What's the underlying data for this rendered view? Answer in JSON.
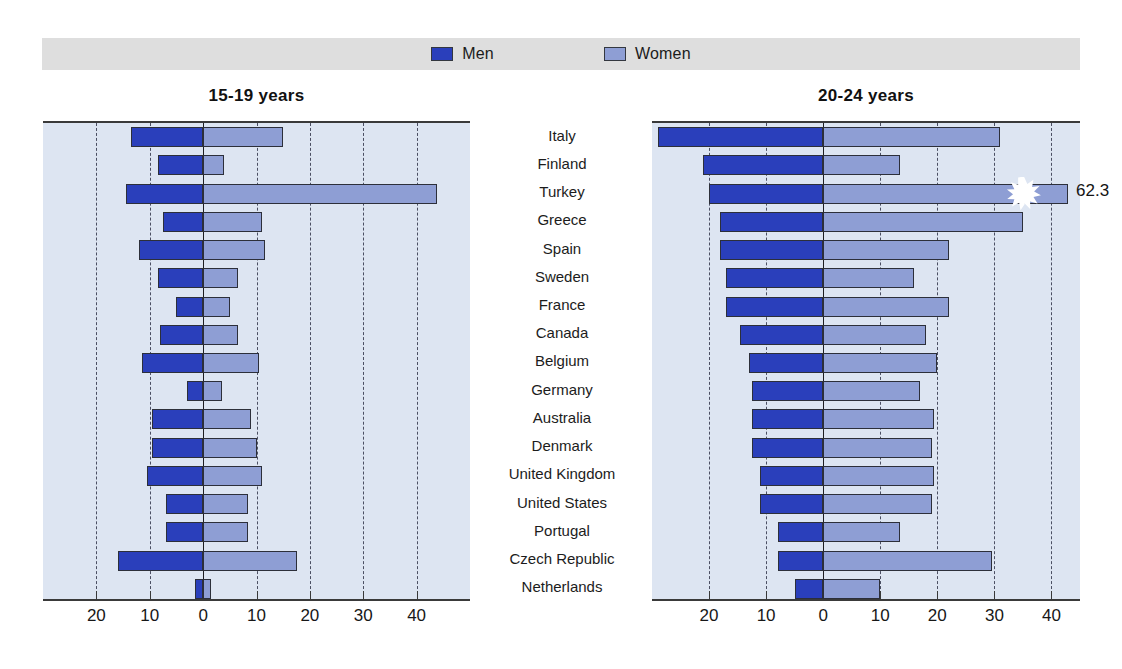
{
  "legend": {
    "items": [
      {
        "label": "Men",
        "color": "#2a3fbb",
        "icon": "legend-swatch-men"
      },
      {
        "label": "Women",
        "color": "#8e9ed4",
        "icon": "legend-swatch-women"
      }
    ],
    "band_color": "#dedede"
  },
  "panels": {
    "left_title": "15-19 years",
    "right_title": "20-24 years"
  },
  "chart_data": [
    {
      "type": "bar",
      "title": "15-19 years",
      "orientation": "horizontal",
      "layout": "bidirectional-pyramid",
      "grid": true,
      "legend_position": "top-center",
      "xlabel": "",
      "ylabel": "",
      "axis_ticks": [
        "30",
        "20",
        "10",
        "0",
        "10",
        "20",
        "30",
        "40",
        "50"
      ],
      "xlim": [
        -30,
        50
      ],
      "categories": [
        "Italy",
        "Finland",
        "Turkey",
        "Greece",
        "Spain",
        "Sweden",
        "France",
        "Canada",
        "Belgium",
        "Germany",
        "Australia",
        "Denmark",
        "United Kingdom",
        "United States",
        "Portugal",
        "Czech Republic",
        "Netherlands"
      ],
      "series": [
        {
          "name": "Men",
          "side": "left",
          "color": "#2a3fbb",
          "values": [
            13.5,
            8.5,
            14.5,
            7.5,
            12.0,
            8.5,
            5.0,
            8.0,
            11.5,
            3.0,
            9.5,
            9.5,
            10.5,
            7.0,
            7.0,
            16.0,
            1.5
          ]
        },
        {
          "name": "Women",
          "side": "right",
          "color": "#8e9ed4",
          "values": [
            15.0,
            4.0,
            43.8,
            11.0,
            11.5,
            6.5,
            5.0,
            6.5,
            10.5,
            3.5,
            9.0,
            10.0,
            11.0,
            8.5,
            8.5,
            17.5,
            1.5
          ]
        }
      ]
    },
    {
      "type": "bar",
      "title": "20-24 years",
      "orientation": "horizontal",
      "layout": "bidirectional-pyramid",
      "grid": true,
      "legend_position": "top-center",
      "xlabel": "",
      "ylabel": "",
      "axis_ticks": [
        "30",
        "20",
        "10",
        "0",
        "10",
        "20",
        "30",
        "40"
      ],
      "xlim": [
        -30,
        45
      ],
      "categories": [
        "Italy",
        "Finland",
        "Turkey",
        "Greece",
        "Spain",
        "Sweden",
        "France",
        "Canada",
        "Belgium",
        "Germany",
        "Australia",
        "Denmark",
        "United Kingdom",
        "United States",
        "Portugal",
        "Czech Republic",
        "Netherlands"
      ],
      "series": [
        {
          "name": "Men",
          "side": "left",
          "color": "#2a3fbb",
          "values": [
            29.0,
            21.0,
            20.0,
            18.0,
            18.0,
            17.0,
            17.0,
            14.5,
            13.0,
            12.5,
            12.5,
            12.5,
            11.0,
            11.0,
            8.0,
            8.0,
            5.0
          ]
        },
        {
          "name": "Women",
          "side": "right",
          "color": "#8e9ed4",
          "values": [
            31.0,
            13.5,
            60.0,
            35.0,
            22.0,
            16.0,
            22.0,
            18.0,
            20.0,
            17.0,
            19.5,
            19.0,
            19.5,
            19.0,
            13.5,
            29.5,
            10.0
          ]
        }
      ],
      "annotations": [
        {
          "category": "Turkey",
          "series": "Women",
          "label": "62.3",
          "note": "bar truncated with break symbol"
        }
      ]
    }
  ]
}
